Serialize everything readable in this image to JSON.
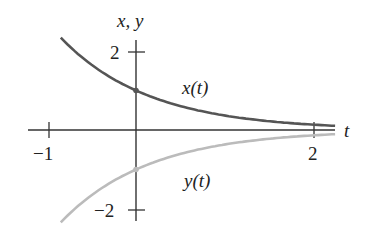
{
  "chart_data": {
    "type": "line",
    "title": "",
    "xlabel": "t",
    "ylabel": "x, y",
    "x_ticks": [
      -1,
      2
    ],
    "y_ticks": [
      2,
      -2
    ],
    "x_tick_labels": [
      "−1",
      "2"
    ],
    "y_tick_labels": [
      "2",
      "−2"
    ],
    "xlim": [
      -1.2,
      2.25
    ],
    "ylim": [
      -2.5,
      2.3
    ],
    "grid": false,
    "legend": "inline labels",
    "series": [
      {
        "name": "x(t)",
        "color": "#555555",
        "formula": "e^(-t)",
        "x": [
          -0.85,
          -0.75,
          -0.5,
          -0.25,
          0,
          0.25,
          0.5,
          0.75,
          1.0,
          1.25,
          1.5,
          1.75,
          2.0,
          2.25
        ],
        "values": [
          2.34,
          2.12,
          1.65,
          1.28,
          1.0,
          0.78,
          0.61,
          0.47,
          0.37,
          0.29,
          0.22,
          0.17,
          0.14,
          0.11
        ]
      },
      {
        "name": "y(t)",
        "color": "#bbbbbb",
        "formula": "-e^(-t)",
        "x": [
          -0.85,
          -0.75,
          -0.5,
          -0.25,
          0,
          0.25,
          0.5,
          0.75,
          1.0,
          1.25,
          1.5,
          1.75,
          2.0,
          2.25
        ],
        "values": [
          -2.34,
          -2.12,
          -1.65,
          -1.28,
          -1.0,
          -0.78,
          -0.61,
          -0.47,
          -0.37,
          -0.29,
          -0.22,
          -0.17,
          -0.14,
          -0.11
        ]
      }
    ],
    "annotations": [
      {
        "text": "x(t)",
        "x": 0.55,
        "y": 1.05
      },
      {
        "text": "y(t)",
        "x": 0.55,
        "y": -1.3
      },
      {
        "point": [
          0,
          1
        ],
        "marker": "dot"
      },
      {
        "point": [
          0,
          -1
        ],
        "marker": "dot"
      }
    ]
  },
  "labels": {
    "axis_y": "x, y",
    "axis_x": "t",
    "series_x": "x(t)",
    "series_y": "y(t)",
    "tick_x_neg1": "−1",
    "tick_x_2": "2",
    "tick_y_2": "2",
    "tick_y_neg2": "−2"
  }
}
